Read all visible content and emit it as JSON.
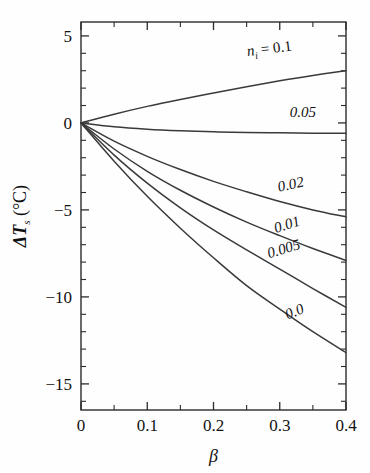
{
  "chart_data": {
    "type": "line",
    "title": "",
    "xlabel": "β",
    "ylabel": "ΔTₛ (°C)",
    "ylabel_main": "ΔT",
    "ylabel_sub": "s",
    "ylabel_unit": "(°C)",
    "xlim": [
      0,
      0.4
    ],
    "ylim": [
      -16.5,
      5.8
    ],
    "grid": false,
    "legend_position": "inline-curve-labels",
    "xticks": [
      0,
      0.1,
      0.2,
      0.3,
      0.4
    ],
    "xtick_labels": [
      "0",
      "0.1",
      "0.2",
      "0.3",
      "0.4"
    ],
    "xminor_ticks": [
      0.05,
      0.15,
      0.25,
      0.35
    ],
    "yticks": [
      5,
      0,
      -5,
      -10,
      -15
    ],
    "ytick_labels": [
      "5",
      "0",
      "−5",
      "−10",
      "−15"
    ],
    "yminor_ticks": [
      4,
      3,
      2,
      1,
      -1,
      -2,
      -3,
      -4,
      -6,
      -7,
      -8,
      -9,
      -11,
      -12,
      -13,
      -14,
      -16
    ],
    "series_variable": "n_i",
    "series_variable_label": "n",
    "series_variable_sub": "i",
    "x": [
      0,
      0.05,
      0.1,
      0.15,
      0.2,
      0.25,
      0.3,
      0.35,
      0.4
    ],
    "series": [
      {
        "name": "0.1",
        "label": "nᵢ = 0.1",
        "label_prefix": "n",
        "label_sub": "i",
        "label_eq": " = 0.1",
        "values": [
          0.0,
          0.5,
          0.95,
          1.35,
          1.72,
          2.08,
          2.42,
          2.73,
          3.0
        ],
        "label_x": 0.285,
        "label_y": 4.0,
        "label_rotation": -7
      },
      {
        "name": "0.05",
        "label": "0.05",
        "values": [
          0.0,
          -0.22,
          -0.36,
          -0.45,
          -0.51,
          -0.55,
          -0.57,
          -0.59,
          -0.6
        ],
        "label_x": 0.335,
        "label_y": 0.35,
        "label_rotation": 0
      },
      {
        "name": "0.02",
        "label": "0.02",
        "values": [
          0.0,
          -1.05,
          -1.92,
          -2.68,
          -3.36,
          -3.96,
          -4.52,
          -5.0,
          -5.4
        ],
        "label_x": 0.318,
        "label_y": -3.8,
        "label_rotation": -12
      },
      {
        "name": "0.01",
        "label": "0.01",
        "values": [
          0.0,
          -1.5,
          -2.78,
          -3.87,
          -4.83,
          -5.7,
          -6.48,
          -7.22,
          -7.9
        ],
        "label_x": 0.313,
        "label_y": -6.1,
        "label_rotation": -17
      },
      {
        "name": "0.005",
        "label": "0.005",
        "values": [
          0.0,
          -1.85,
          -3.46,
          -4.88,
          -6.15,
          -7.3,
          -8.4,
          -9.52,
          -10.6
        ],
        "label_x": 0.308,
        "label_y": -7.5,
        "label_rotation": -17
      },
      {
        "name": "0.0",
        "label": "0.0",
        "values": [
          0.0,
          -2.2,
          -4.22,
          -6.05,
          -7.75,
          -9.35,
          -10.7,
          -12.0,
          -13.2
        ],
        "label_x": 0.325,
        "label_y": -11.1,
        "label_rotation": -22
      }
    ],
    "colors": {
      "curve": "#3a3a3a",
      "axis": "#2b2b2b",
      "text": "#111111",
      "background": "#fefefe"
    }
  }
}
